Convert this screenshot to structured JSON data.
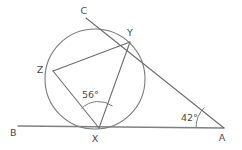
{
  "diagram": {
    "type": "circle-geometry",
    "canvas": {
      "width": 242,
      "height": 150,
      "background": "#ffffff"
    },
    "stroke_color": "#6b6b6b",
    "label_color": "#4a4a4a",
    "circle": {
      "cx": 95,
      "cy": 79,
      "r": 50
    },
    "points": [
      {
        "name": "B",
        "label": "B",
        "x": 18,
        "y": 126,
        "label_x": 10,
        "label_y": 136,
        "on_circle": false
      },
      {
        "name": "X",
        "label": "X",
        "x": 99,
        "y": 128,
        "label_x": 95,
        "label_y": 142,
        "on_circle": true
      },
      {
        "name": "A",
        "label": "A",
        "x": 224,
        "y": 128,
        "label_x": 222,
        "label_y": 141,
        "on_circle": false
      },
      {
        "name": "Z",
        "label": "Z",
        "x": 53,
        "y": 71,
        "label_x": 40,
        "label_y": 73,
        "on_circle": true
      },
      {
        "name": "Y",
        "label": "Y",
        "x": 130,
        "y": 42,
        "label_x": 130,
        "label_y": 36,
        "on_circle": true
      },
      {
        "name": "C",
        "label": "C",
        "x": 86,
        "y": 18,
        "label_x": 84,
        "label_y": 14,
        "on_circle": false
      }
    ],
    "segments": [
      {
        "name": "baseline-BA",
        "from": "B",
        "to": "A",
        "style": "baseline"
      },
      {
        "name": "secant-CYA",
        "from": "C",
        "to": "A",
        "style": "line"
      },
      {
        "name": "chord-XY",
        "from": "X",
        "to": "Y",
        "style": "line"
      },
      {
        "name": "chord-XZ",
        "from": "X",
        "to": "Z",
        "style": "line"
      },
      {
        "name": "chord-ZY",
        "from": "Z",
        "to": "Y",
        "style": "line"
      }
    ],
    "angles": [
      {
        "name": "angle-at-X",
        "value": "56°",
        "vertex": "X",
        "label_x": 82,
        "label_y": 98,
        "arc_path": "M 81.5 108.5 A 24 24 0 0 1 112.5 106.0"
      },
      {
        "name": "angle-at-A",
        "value": "42°",
        "vertex": "A",
        "label_x": 181,
        "label_y": 121,
        "arc_path": "M 196 127.5 A 28 28 0 0 1 204.5 107.5"
      }
    ]
  }
}
